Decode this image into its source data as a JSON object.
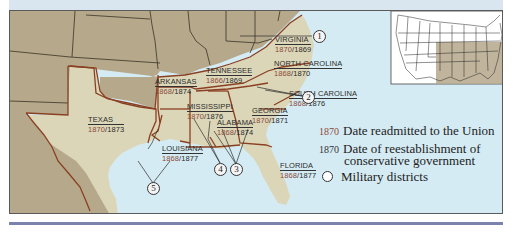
{
  "map": {
    "title": "Reconstruction in the South",
    "states": [
      {
        "name": "VIRGINIA",
        "readmitted": "1870",
        "conservative": "1869"
      },
      {
        "name": "TENNESSEE",
        "readmitted": "1866",
        "conservative": "1869"
      },
      {
        "name": "NORTH CAROLINA",
        "readmitted": "1868",
        "conservative": "1870"
      },
      {
        "name": "ARKANSAS",
        "readmitted": "1868",
        "conservative": "1874"
      },
      {
        "name": "SOUTH CAROLINA",
        "readmitted": "1868",
        "conservative": "1876"
      },
      {
        "name": "MISSISSIPPI",
        "readmitted": "1870",
        "conservative": "1876"
      },
      {
        "name": "GEORGIA",
        "readmitted": "1870",
        "conservative": "1871"
      },
      {
        "name": "ALABAMA",
        "readmitted": "1868",
        "conservative": "1874"
      },
      {
        "name": "TEXAS",
        "readmitted": "1870",
        "conservative": "1873"
      },
      {
        "name": "LOUISIANA",
        "readmitted": "1868",
        "conservative": "1877"
      },
      {
        "name": "FLORIDA",
        "readmitted": "1868",
        "conservative": "1877"
      }
    ],
    "districts": [
      "1",
      "2",
      "3",
      "4",
      "5"
    ],
    "separator": "/"
  },
  "legend": {
    "readmitted": {
      "year": "1870",
      "label": "Date readmitted to the Union"
    },
    "conservative": {
      "year": "1870",
      "label_line1": "Date of reestablishment of",
      "label_line2": "conservative government"
    },
    "districts": {
      "label": "Military districts"
    }
  },
  "colors": {
    "confederate_land": "#dcd6b8",
    "other_land": "#b5a88b",
    "water": "#d5ebf3",
    "border_red": "#8a3f22",
    "readmitted_year": "#8b4a3a",
    "rule": "#7b83ad"
  }
}
